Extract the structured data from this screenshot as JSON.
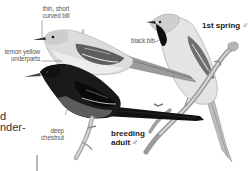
{
  "figure": {
    "colors": {
      "background": "#ffffff",
      "label_text": "#555555",
      "plumage_label": "#1a1a1a",
      "female_body": "#d6d6d6",
      "male_adult_body": "#1c1c1c",
      "chestnut": "#5a5a5a"
    },
    "birds": [
      {
        "id": "female",
        "symbol": "♀",
        "annotations": [
          {
            "text_line1": "thin, short",
            "text_line2": "curved bill"
          },
          {
            "text_line1": "lemon yellow",
            "text_line2": "underparts"
          }
        ]
      },
      {
        "id": "breeding-adult-male",
        "label_line1": "breeding",
        "label_line2": "adult",
        "symbol": "♂",
        "annotations": [
          {
            "text_line1": "deep",
            "text_line2": "chestnut"
          }
        ]
      },
      {
        "id": "first-spring-male",
        "label": "1st spring",
        "symbol": "♂",
        "annotations": [
          {
            "text": "black bib"
          }
        ]
      }
    ]
  },
  "body_text_fragments": {
    "line1": "d",
    "line2": "nder-"
  }
}
